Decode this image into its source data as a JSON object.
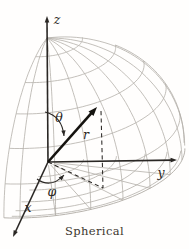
{
  "diagram": {
    "caption": "Spherical",
    "canvas": {
      "width": 189,
      "height": 249,
      "background": "#fffefd"
    },
    "colors": {
      "grid": "#b4b0aa",
      "axis": "#2a2724",
      "vector": "#15130f",
      "label": "#2a2724",
      "caption": "#3c362e"
    },
    "projection": {
      "origin": [
        48,
        162
      ],
      "radius": 124,
      "xhat": [
        -0.2258,
        0.4516
      ],
      "yhat": [
        1.081,
        -0.0161
      ],
      "zhat": [
        -0.0081,
        -1.0
      ]
    },
    "sphere_grid": {
      "meridians_phi_deg": [
        -7,
        0,
        15,
        30,
        45,
        60,
        75,
        90,
        105
      ],
      "meridian_theta_range": [
        0,
        90
      ],
      "right_limb_phi_deg": 108,
      "right_limb_theta_range": [
        30,
        90
      ],
      "latitudes_theta_deg": [
        15,
        30,
        45,
        60,
        75
      ],
      "latitude_phi_range": [
        -7,
        108
      ],
      "equator_phi_range": [
        -7,
        102
      ]
    },
    "plane_grid": {
      "rays_phi_deg": [
        15,
        30,
        45,
        60,
        75
      ],
      "ray_r_range": [
        0.06,
        1.0
      ],
      "arcs_r": [
        0.26,
        0.5,
        0.71,
        0.87,
        0.97
      ],
      "arc_phi_range": [
        -4,
        100
      ]
    },
    "axes": {
      "z": {
        "label": "z",
        "from": [
          48,
          162
        ],
        "tip": [
          47,
          16
        ],
        "label_pos": [
          57,
          24
        ]
      },
      "y": {
        "label": "y",
        "from": [
          48,
          162
        ],
        "tip": [
          177,
          160
        ],
        "label_pos": [
          161,
          177
        ]
      },
      "x": {
        "label": "x",
        "from": [
          48,
          162
        ],
        "tip": [
          13,
          237
        ],
        "label_pos": [
          28,
          212
        ]
      }
    },
    "vector_r": {
      "label": "r",
      "from": [
        48,
        162
      ],
      "tip": [
        97,
        107
      ],
      "label_pos": [
        86,
        139
      ]
    },
    "dashed_lines": {
      "vertical": {
        "from": [
          101,
          111
        ],
        "to": [
          103,
          188
        ]
      },
      "radial": {
        "from": [
          48,
          162
        ],
        "to": [
          103,
          188
        ]
      }
    },
    "angle_arrows": {
      "theta": {
        "label": "θ",
        "start": [
          45,
          112
        ],
        "control": [
          62,
          116
        ],
        "end": [
          64,
          136
        ],
        "label_pos": [
          59,
          122
        ]
      },
      "phi": {
        "label": "φ",
        "start": [
          37,
          179
        ],
        "control": [
          51,
          189
        ],
        "end": [
          64,
          175
        ],
        "label_pos": [
          52,
          196
        ]
      }
    }
  }
}
